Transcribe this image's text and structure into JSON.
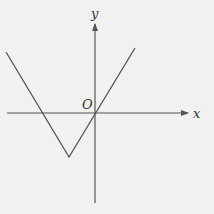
{
  "diagram": {
    "type": "function-graph",
    "labels": {
      "x_axis": "x",
      "y_axis": "y",
      "origin": "O"
    },
    "colors": {
      "background": "#f1f1f0",
      "axis": "#555555",
      "curve": "#555555",
      "text": "#333333"
    },
    "axes": {
      "origin_px": [
        95,
        113
      ],
      "x_axis": {
        "from": [
          7,
          113
        ],
        "to": [
          188,
          113
        ],
        "arrow": true
      },
      "y_axis": {
        "from": [
          95,
          203
        ],
        "to": [
          95,
          24
        ],
        "arrow": true
      }
    },
    "curve": {
      "points_px": [
        [
          6,
          52
        ],
        [
          69,
          157
        ],
        [
          135,
          48
        ]
      ],
      "vertex_px": [
        69,
        157
      ],
      "x_intercepts_px": [
        [
          42,
          113
        ],
        [
          95,
          113
        ]
      ]
    }
  }
}
